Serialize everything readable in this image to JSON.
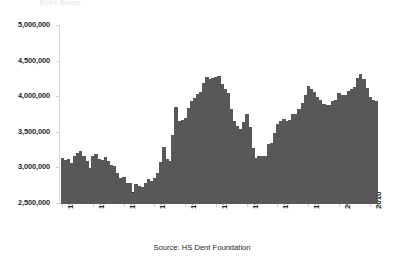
{
  "figure": {
    "title_remnant": "Echo Boom",
    "source_note": "Source: HS Dent Foundation",
    "bar_color": "#58585a",
    "axis_color": "#d8d8da",
    "background": "#ffffff"
  },
  "chart_data": {
    "type": "bar",
    "title": "",
    "subtitle": "",
    "xlabel": "",
    "ylabel": "",
    "grid": false,
    "legend": "none",
    "ylim": [
      2500000,
      5000000
    ],
    "xlim": [
      1909,
      2013
    ],
    "ytick_labels": [
      "5,000,000",
      "4,500,000",
      "4,000,000",
      "3,500,000",
      "3,000,000",
      "2,500,000"
    ],
    "ytick_values": [
      5000000,
      4500000,
      4000000,
      3500000,
      3000000,
      2500000
    ],
    "xtick_labels": [
      "1910",
      "1920",
      "1930",
      "1940",
      "1950",
      "1960",
      "1970",
      "1980",
      "1990",
      "2000",
      "2010"
    ],
    "xtick_values": [
      1910,
      1920,
      1930,
      1940,
      1950,
      1960,
      1970,
      1980,
      1990,
      2000,
      2010
    ],
    "series_name": "Births",
    "categories": [
      1910,
      1911,
      1912,
      1913,
      1914,
      1915,
      1916,
      1917,
      1918,
      1919,
      1920,
      1921,
      1922,
      1923,
      1924,
      1925,
      1926,
      1927,
      1928,
      1929,
      1930,
      1931,
      1932,
      1933,
      1934,
      1935,
      1936,
      1937,
      1938,
      1939,
      1940,
      1941,
      1942,
      1943,
      1944,
      1945,
      1946,
      1947,
      1948,
      1949,
      1950,
      1951,
      1952,
      1953,
      1954,
      1955,
      1956,
      1957,
      1958,
      1959,
      1960,
      1961,
      1962,
      1963,
      1964,
      1965,
      1966,
      1967,
      1968,
      1969,
      1970,
      1971,
      1972,
      1973,
      1974,
      1975,
      1976,
      1977,
      1978,
      1979,
      1980,
      1981,
      1982,
      1983,
      1984,
      1985,
      1986,
      1987,
      1988,
      1989,
      1990,
      1991,
      1992,
      1993,
      1994,
      1995,
      1996,
      1997,
      1998,
      1999,
      2000,
      2001,
      2002,
      2003,
      2004,
      2005,
      2006,
      2007,
      2008,
      2009,
      2010,
      2011,
      2012
    ],
    "values": [
      3150000,
      3120000,
      3130000,
      3080000,
      3170000,
      3210000,
      3240000,
      3180000,
      3100000,
      3000000,
      3170000,
      3200000,
      3130000,
      3120000,
      3160000,
      3100000,
      3050000,
      3030000,
      2940000,
      2870000,
      2880000,
      2790000,
      2800000,
      2660000,
      2780000,
      2760000,
      2740000,
      2790000,
      2850000,
      2830000,
      2860000,
      2940000,
      3090000,
      3300000,
      3130000,
      3100000,
      3470000,
      3860000,
      3660000,
      3680000,
      3710000,
      3850000,
      3940000,
      3990000,
      4040000,
      4080000,
      4200000,
      4290000,
      4250000,
      4270000,
      4280000,
      4300000,
      4190000,
      4120000,
      4060000,
      3830000,
      3670000,
      3590000,
      3550000,
      3650000,
      3760000,
      3580000,
      3280000,
      3150000,
      3170000,
      3170000,
      3180000,
      3340000,
      3350000,
      3500000,
      3630000,
      3660000,
      3690000,
      3660000,
      3680000,
      3760000,
      3760000,
      3830000,
      3920000,
      4030000,
      4160000,
      4120000,
      4070000,
      4000000,
      3960000,
      3900000,
      3890000,
      3890000,
      3940000,
      3960000,
      4060000,
      4030000,
      4030000,
      4090000,
      4110000,
      4140000,
      4270000,
      4320000,
      4250000,
      4130000,
      3999000,
      3954000,
      3953000
    ],
    "annotations": [
      {
        "label": "Baby Boom peak",
        "year": 1957,
        "value": 4290000
      },
      {
        "label": "Depression trough",
        "year": 1933,
        "value": 2660000
      },
      {
        "label": "Echo Boom peak",
        "year": 2007,
        "value": 4320000
      },
      {
        "label": "Baby Bust trough",
        "year": 1973,
        "value": 3150000
      }
    ]
  },
  "axes_geometry": {
    "plot_left_px": 59,
    "plot_right_px": 379,
    "plot_top_px": 25,
    "plot_bottom_px": 203
  }
}
